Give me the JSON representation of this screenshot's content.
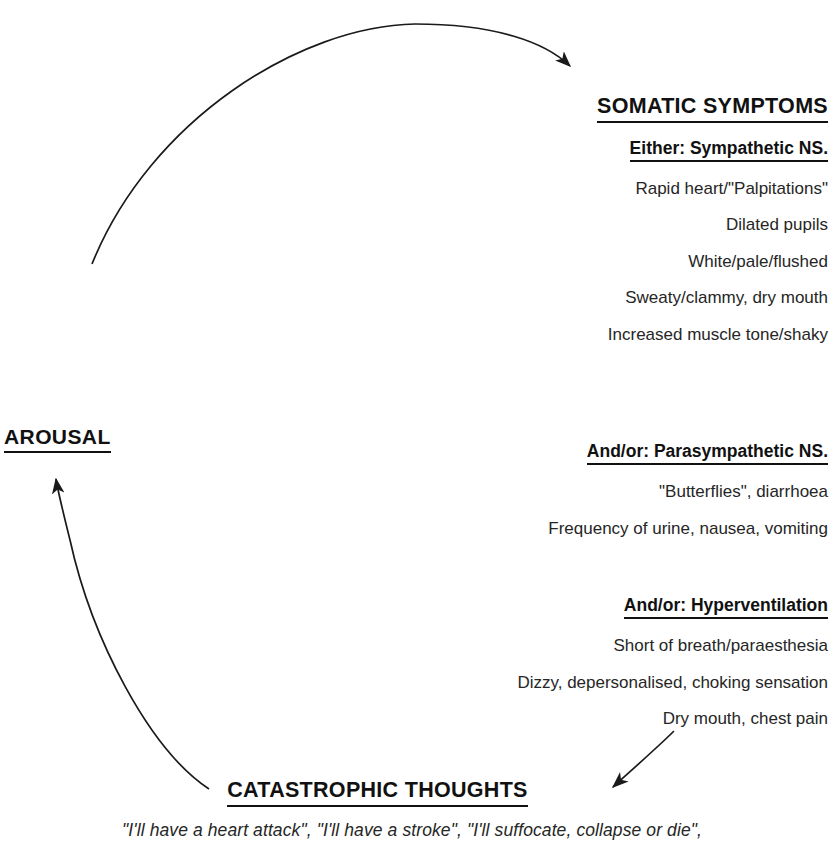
{
  "diagram": {
    "stroke_color": "#1a1a1a",
    "background_color": "#ffffff"
  },
  "nodes": {
    "arousal": {
      "label": "AROUSAL"
    },
    "somatic": {
      "heading": "SOMATIC SYMPTOMS",
      "groups": [
        {
          "subheading": "Either: Sympathetic NS.",
          "lines": [
            "Rapid heart/\"Palpitations\"",
            "Dilated pupils",
            "White/pale/flushed",
            "Sweaty/clammy, dry mouth",
            "Increased muscle tone/shaky"
          ]
        },
        {
          "subheading": "And/or: Parasympathetic NS.",
          "lines": [
            "\"Butterflies\", diarrhoea",
            "Frequency of urine, nausea, vomiting"
          ]
        },
        {
          "subheading": "And/or: Hyperventilation",
          "lines": [
            "Short of breath/paraesthesia",
            "Dizzy, depersonalised, choking sensation",
            "Dry mouth, chest pain"
          ]
        }
      ]
    },
    "catastrophic": {
      "heading": "CATASTROPHIC THOUGHTS",
      "quote": "\"I'll have a heart attack\", \"I'll have a stroke\", \"I'll suffocate, collapse or die\","
    }
  },
  "connectors": [
    {
      "name": "arousal-to-somatic",
      "from": "AROUSAL",
      "to": "SOMATIC SYMPTOMS",
      "style": "curved arc with arrowhead"
    },
    {
      "name": "somatic-to-catastrophic",
      "from": "SOMATIC SYMPTOMS",
      "to": "CATASTROPHIC THOUGHTS",
      "style": "short straight arrow with arrowhead"
    },
    {
      "name": "catastrophic-to-arousal",
      "from": "CATASTROPHIC THOUGHTS",
      "to": "AROUSAL",
      "style": "curved arc with arrowhead"
    }
  ]
}
